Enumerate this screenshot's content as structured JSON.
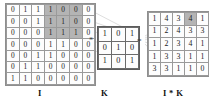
{
  "diagram": {
    "operators": {
      "convolve": "*",
      "equals": "="
    },
    "captions": {
      "input": "I",
      "kernel": "K",
      "output": "I * K"
    },
    "colors": {
      "highlight": "#b4b4b4",
      "cell_border": "#9a9a9a",
      "kernel_border": "#5c5c5c",
      "text": "#1a1a1a",
      "link_line": "#b9b9b9",
      "background": "#ffffff"
    }
  },
  "chart_data": {
    "type": "table",
    "matrices": [
      {
        "name": "I",
        "label": "I",
        "rows": 7,
        "cols": 7,
        "values": [
          [
            0,
            1,
            1,
            1,
            0,
            0,
            0
          ],
          [
            0,
            0,
            1,
            1,
            1,
            0,
            0
          ],
          [
            0,
            0,
            0,
            1,
            1,
            1,
            0
          ],
          [
            0,
            0,
            0,
            1,
            1,
            0,
            0
          ],
          [
            0,
            0,
            1,
            1,
            0,
            0,
            0
          ],
          [
            0,
            1,
            1,
            0,
            0,
            0,
            0
          ],
          [
            1,
            1,
            0,
            0,
            0,
            0,
            0
          ]
        ],
        "highlight_cells": [
          [
            0,
            3
          ],
          [
            0,
            4
          ],
          [
            0,
            5
          ],
          [
            1,
            3
          ],
          [
            1,
            4
          ],
          [
            1,
            5
          ],
          [
            2,
            3
          ],
          [
            2,
            4
          ],
          [
            2,
            5
          ]
        ]
      },
      {
        "name": "K",
        "label": "K",
        "rows": 3,
        "cols": 3,
        "values": [
          [
            1,
            0,
            1
          ],
          [
            0,
            1,
            0
          ],
          [
            1,
            0,
            1
          ]
        ],
        "highlight_cells": []
      },
      {
        "name": "I*K",
        "label": "I * K",
        "rows": 5,
        "cols": 5,
        "values": [
          [
            1,
            4,
            3,
            4,
            1
          ],
          [
            1,
            2,
            4,
            3,
            3
          ],
          [
            1,
            2,
            3,
            4,
            1
          ],
          [
            1,
            3,
            3,
            1,
            1
          ],
          [
            3,
            3,
            1,
            1,
            0
          ]
        ],
        "highlight_cells": [
          [
            0,
            3
          ]
        ]
      }
    ]
  }
}
